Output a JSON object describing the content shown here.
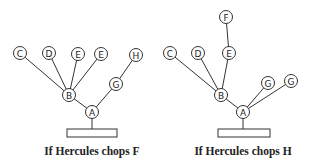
{
  "diagrams": [
    {
      "caption": "If Hercules chops F",
      "nodes": [
        {
          "id": "A",
          "label": "A",
          "x": 92,
          "y": 112
        },
        {
          "id": "B",
          "label": "B",
          "x": 69,
          "y": 95
        },
        {
          "id": "C",
          "label": "C",
          "x": 20,
          "y": 53
        },
        {
          "id": "D",
          "label": "D",
          "x": 49,
          "y": 53
        },
        {
          "id": "E1",
          "label": "E",
          "x": 78,
          "y": 54
        },
        {
          "id": "E2",
          "label": "E",
          "x": 101,
          "y": 54
        },
        {
          "id": "G",
          "label": "G",
          "x": 116,
          "y": 84
        },
        {
          "id": "H",
          "label": "H",
          "x": 136,
          "y": 55
        }
      ],
      "edges": [
        [
          "A",
          "B"
        ],
        [
          "B",
          "C"
        ],
        [
          "B",
          "D"
        ],
        [
          "B",
          "E1"
        ],
        [
          "B",
          "E2"
        ],
        [
          "A",
          "G"
        ],
        [
          "G",
          "H"
        ]
      ],
      "base": {
        "x": 67,
        "y": 129,
        "w": 50,
        "h": 8
      }
    },
    {
      "caption": "If Hercules chops H",
      "nodes": [
        {
          "id": "A",
          "label": "A",
          "x": 243,
          "y": 112
        },
        {
          "id": "B",
          "label": "B",
          "x": 221,
          "y": 95
        },
        {
          "id": "C",
          "label": "C",
          "x": 170,
          "y": 53
        },
        {
          "id": "D",
          "label": "D",
          "x": 198,
          "y": 53
        },
        {
          "id": "E",
          "label": "E",
          "x": 229,
          "y": 53
        },
        {
          "id": "F",
          "label": "F",
          "x": 226,
          "y": 17
        },
        {
          "id": "G1",
          "label": "G",
          "x": 268,
          "y": 83
        },
        {
          "id": "G2",
          "label": "G",
          "x": 291,
          "y": 81
        }
      ],
      "edges": [
        [
          "A",
          "B"
        ],
        [
          "B",
          "C"
        ],
        [
          "B",
          "D"
        ],
        [
          "B",
          "E"
        ],
        [
          "E",
          "F"
        ],
        [
          "A",
          "G1"
        ],
        [
          "A",
          "G2"
        ]
      ],
      "base": {
        "x": 218,
        "y": 129,
        "w": 52,
        "h": 8
      }
    }
  ]
}
